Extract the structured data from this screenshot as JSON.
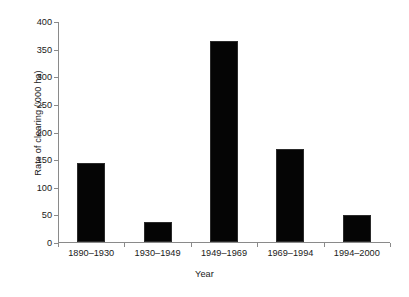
{
  "chart_data": {
    "type": "bar",
    "title": "",
    "xlabel": "Year",
    "ylabel": "Rate of clearing ('000 ha)",
    "categories": [
      "1890–1930",
      "1930–1949",
      "1949–1969",
      "1969–1994",
      "1994–2000"
    ],
    "values": [
      143,
      36,
      363,
      168,
      49
    ],
    "ylim": [
      0,
      400
    ],
    "yticks": [
      0,
      50,
      100,
      150,
      200,
      250,
      300,
      350,
      400
    ],
    "ytick_labels": [
      "0",
      "50",
      "100",
      "150",
      "200",
      "250",
      "300",
      "350",
      "400"
    ],
    "xlim_categories": 5,
    "grid": false,
    "legend": null,
    "series": [
      {
        "name": "Rate of clearing",
        "values": [
          143,
          36,
          363,
          168,
          49
        ],
        "color": "#050505"
      }
    ],
    "colors": {
      "bar_fill": "#050505",
      "bar_edge": "#2b2b2b",
      "axis": "#8a8a8a",
      "text": "#1a1a1a",
      "background": "#ffffff"
    }
  }
}
